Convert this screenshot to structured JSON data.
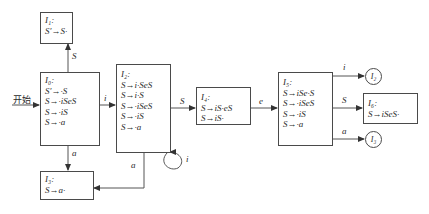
{
  "start_label": "开始",
  "states": [
    {
      "id": "I1",
      "name": "I₁:",
      "items": [
        "S′→S·"
      ]
    },
    {
      "id": "I0",
      "name": "I₀:",
      "items": [
        "S′→·S",
        "S→·iSeS",
        "S→·iS",
        "S→·a"
      ]
    },
    {
      "id": "I2",
      "name": "I₂:",
      "items": [
        "S→i·SeS",
        "S→i·S",
        "S→·iSeS",
        "S→·iS",
        "S→·a"
      ]
    },
    {
      "id": "I3",
      "name": "I₃:",
      "items": [
        "S→a·"
      ]
    },
    {
      "id": "I4",
      "name": "I₄:",
      "items": [
        "S→iS·eS",
        "S→iS·"
      ]
    },
    {
      "id": "I5",
      "name": "I₅:",
      "items": [
        "S→iSe·S",
        "S→·iSeS",
        "S→·iS",
        "S→·a"
      ]
    },
    {
      "id": "I6",
      "name": "I₆:",
      "items": [
        "S→iSeS·"
      ]
    }
  ],
  "refs": [
    {
      "id": "ref-I2",
      "label": "I₂"
    },
    {
      "id": "ref-I3",
      "label": "I₃"
    }
  ],
  "transitions": [
    {
      "from": "I0",
      "to": "I1",
      "symbol": "S"
    },
    {
      "from": "I0",
      "to": "I2",
      "symbol": "i"
    },
    {
      "from": "I0",
      "to": "I3",
      "symbol": "a"
    },
    {
      "from": "I2",
      "to": "I2",
      "symbol": "i"
    },
    {
      "from": "I2",
      "to": "I3",
      "symbol": "a"
    },
    {
      "from": "I2",
      "to": "I4",
      "symbol": "S"
    },
    {
      "from": "I4",
      "to": "I5",
      "symbol": "e"
    },
    {
      "from": "I5",
      "to": "I2",
      "symbol": "i"
    },
    {
      "from": "I5",
      "to": "I6",
      "symbol": "S"
    },
    {
      "from": "I5",
      "to": "I3",
      "symbol": "a"
    }
  ]
}
